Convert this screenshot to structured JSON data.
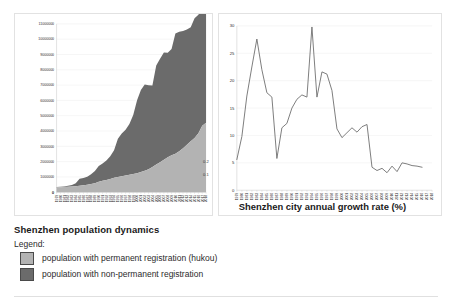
{
  "caption": {
    "title": "Shenzhen population dynamics",
    "legend_label": "Legend:",
    "legend": [
      {
        "swatch_color": "#b3b3b3",
        "text": "population with permanent registration (hukou)"
      },
      {
        "swatch_color": "#6b6b6b",
        "text": "population with non-permanent registration"
      }
    ]
  },
  "left_chart_notes": {
    "note_top": "0.2",
    "note_bottom": "0.1",
    "corner_mark": "o"
  },
  "right_chart_corner_mark": "o",
  "chart_data": [
    {
      "type": "area",
      "id": "population-dynamics",
      "title": "Shenzhen population dynamics",
      "xlabel": "",
      "ylabel": "",
      "stacked": true,
      "grid": true,
      "legend_position": "below-figure",
      "ylim": [
        0,
        11000000
      ],
      "yticks": [
        0,
        1000000,
        2000000,
        3000000,
        4000000,
        5000000,
        6000000,
        7000000,
        8000000,
        9000000,
        10000000,
        11000000
      ],
      "ytick_labels": [
        "0",
        "1000000",
        "2000000",
        "3000000",
        "4000000",
        "5000000",
        "6000000",
        "7000000",
        "8000000",
        "9000000",
        "10000000",
        "11000000"
      ],
      "categories": [
        "1979",
        "1980",
        "1981",
        "1982",
        "1983",
        "1984",
        "1985",
        "1986",
        "1987",
        "1988",
        "1989",
        "1990",
        "1991",
        "1992",
        "1993",
        "1994",
        "1995",
        "1996",
        "1997",
        "1998",
        "1999",
        "2000",
        "2001",
        "2002",
        "2003",
        "2004",
        "2005",
        "2006",
        "2007",
        "2008",
        "2009",
        "2010",
        "2011",
        "2012",
        "2013",
        "2014",
        "2015",
        "2016",
        "2017",
        "2018"
      ],
      "series": [
        {
          "name": "population with permanent registration (hukou)",
          "color": "#b3b3b3",
          "values": [
            312600,
            321500,
            334700,
            349800,
            370000,
            395000,
            429000,
            462000,
            495000,
            530000,
            580000,
            685000,
            752000,
            805000,
            867000,
            938000,
            995000,
            1038000,
            1090000,
            1145000,
            1198000,
            1245000,
            1328000,
            1396000,
            1503000,
            1653000,
            1816000,
            1962000,
            2128000,
            2282000,
            2416000,
            2510000,
            2678000,
            2875000,
            3109000,
            3325000,
            3549000,
            3847000,
            4348000,
            4545000
          ]
        },
        {
          "name": "population with non-permanent registration",
          "color": "#6b6b6b",
          "values": [
            21000,
            30000,
            46000,
            70000,
            110000,
            190000,
            452000,
            471000,
            510000,
            640000,
            812000,
            1037000,
            1130000,
            1274000,
            1488000,
            1811000,
            2496000,
            2795000,
            2995000,
            3307000,
            3849000,
            4767000,
            5358000,
            5644000,
            5481000,
            5324000,
            6461000,
            6754000,
            7002000,
            6834000,
            6937000,
            7856000,
            7806000,
            7666000,
            7518000,
            7453000,
            7828000,
            7750000,
            7682000,
            7477000
          ]
        }
      ]
    },
    {
      "type": "line",
      "id": "annual-growth-rate",
      "title": "Shenzhen city annual growth rate (%)",
      "xlabel": "",
      "ylabel": "",
      "grid": true,
      "ylim": [
        0,
        30
      ],
      "yticks": [
        0,
        5,
        10,
        15,
        20,
        25,
        30
      ],
      "ytick_labels": [
        "0",
        "5",
        "10",
        "15",
        "20",
        "25",
        "30"
      ],
      "categories": [
        "1979",
        "1980",
        "1981",
        "1982",
        "1983",
        "1984",
        "1985",
        "1986",
        "1987",
        "1988",
        "1989",
        "1990",
        "1991",
        "1992",
        "1993",
        "1994",
        "1995",
        "1996",
        "1997",
        "1998",
        "1999",
        "2000",
        "2001",
        "2002",
        "2003",
        "2004",
        "2005",
        "2006",
        "2007",
        "2008",
        "2009",
        "2010",
        "2011",
        "2012",
        "2013",
        "2014",
        "2015",
        "2016",
        "2017",
        "2018"
      ],
      "series": [
        {
          "name": "annual growth rate",
          "color": "#6e6e6e",
          "values": [
            5.6,
            9.8,
            17.2,
            22.5,
            27.6,
            22.0,
            17.8,
            17.0,
            5.8,
            11.4,
            12.2,
            15.0,
            16.6,
            17.4,
            17.0,
            29.8,
            17.0,
            21.6,
            21.2,
            18.2,
            11.2,
            9.6,
            10.5,
            11.4,
            10.6,
            11.6,
            12.0,
            4.2,
            3.6,
            4.0,
            3.2,
            4.4,
            3.4,
            5.0,
            4.8,
            4.5,
            4.4,
            4.2
          ]
        }
      ]
    }
  ]
}
